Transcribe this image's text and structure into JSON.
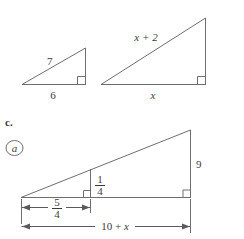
{
  "page": {
    "background_color": "#ffffff",
    "line_color": "#6e6e6e",
    "text_color": "#3b3b3b",
    "width": 244,
    "height": 239
  },
  "problem_label": {
    "letter": "c.",
    "circled_marker": "a"
  },
  "figures": [
    {
      "id": "small-triangle",
      "name": "small-right-triangle",
      "labels": {
        "hypotenuse": "7",
        "base": "6"
      },
      "has_right_angle_marker": true
    },
    {
      "id": "large-triangle",
      "name": "large-right-triangle",
      "labels": {
        "hypotenuse": "x + 2",
        "base": "x"
      },
      "has_right_angle_marker": true
    },
    {
      "id": "nested-triangle",
      "name": "nested-similar-triangles",
      "labels": {
        "outer_height": "9",
        "inner_height_numerator": "1",
        "inner_height_denominator": "4",
        "inner_base_numerator": "5",
        "inner_base_denominator": "4",
        "total_base": "10 + x"
      },
      "has_right_angle_marker": true
    }
  ],
  "chart_data": {
    "type": "diagram",
    "elements": [
      {
        "shape": "right-triangle",
        "name": "small-triangle",
        "vertices": [
          [
            22,
            84
          ],
          [
            85,
            84
          ],
          [
            85,
            50
          ]
        ],
        "annotations": [
          {
            "text": "7",
            "role": "hypotenuse-label"
          },
          {
            "text": "6",
            "role": "base-label"
          }
        ]
      },
      {
        "shape": "right-triangle",
        "name": "large-triangle",
        "vertices": [
          [
            101,
            84
          ],
          [
            205,
            84
          ],
          [
            205,
            19
          ]
        ],
        "annotations": [
          {
            "text": "x + 2",
            "role": "hypotenuse-label"
          },
          {
            "text": "x",
            "role": "base-label"
          }
        ]
      },
      {
        "shape": "nested-right-triangles",
        "name": "nested-triangle",
        "outer_vertices": [
          [
            21,
            197
          ],
          [
            190,
            197
          ],
          [
            190,
            131
          ]
        ],
        "inner_vertices": [
          [
            21,
            197
          ],
          [
            90,
            197
          ],
          [
            90,
            170
          ]
        ],
        "annotations": [
          {
            "text": "9",
            "role": "outer-height-label"
          },
          {
            "text": "1/4",
            "role": "inner-height-label"
          },
          {
            "text": "5/4",
            "role": "inner-base-dimension"
          },
          {
            "text": "10 + x",
            "role": "total-base-dimension"
          }
        ]
      }
    ]
  }
}
